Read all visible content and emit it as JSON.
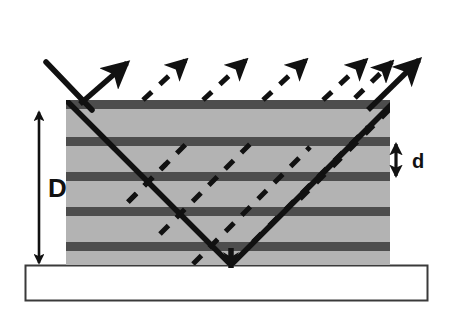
{
  "figure": {
    "labels": {
      "total_thickness": "D",
      "layer_period": "d"
    },
    "colors": {
      "matrix_fill": "#b3b3b3",
      "layer_band": "#4d4d4d",
      "ray_stroke": "#111111",
      "substrate_fill": "#ffffff",
      "substrate_stroke": "#3a3a3a",
      "background": "#ffffff"
    },
    "geometry": {
      "slab": {
        "x": 66,
        "y": 100,
        "width": 324,
        "height": 165
      },
      "substrate": {
        "x": 25,
        "y": 265,
        "width": 403,
        "height": 36
      },
      "band_thickness": 8,
      "band_period": 35,
      "band_tops": [
        100,
        137,
        172,
        207,
        242
      ],
      "incidence_angle_deg": 45
    },
    "dimension_arrows": [
      {
        "name": "D",
        "x": 39,
        "y_top": 110,
        "y_bottom": 265,
        "label_x": 52,
        "label_y": 196
      },
      {
        "name": "d",
        "x": 395,
        "y_top": 142,
        "y_bottom": 177,
        "label_x": 412,
        "label_y": 172
      }
    ],
    "rays": {
      "incident": {
        "style": "solid",
        "from": [
          46,
          62
        ],
        "to": [
          231,
          265
        ]
      },
      "specular_reflected": {
        "style": "solid",
        "from": [
          86,
          104
        ],
        "to": [
          130,
          60
        ]
      },
      "exit": {
        "style": "solid",
        "from": [
          231,
          265
        ],
        "to": [
          418,
          60
        ]
      },
      "diffracted_dashed": [
        {
          "style": "dashed",
          "from": [
            130,
            200
          ],
          "to": [
            186,
            62
          ]
        },
        {
          "style": "dashed",
          "from": [
            160,
            232
          ],
          "to": [
            246,
            62
          ]
        },
        {
          "style": "dashed",
          "from": [
            192,
            262
          ],
          "to": [
            306,
            62
          ]
        },
        {
          "style": "dashed",
          "from": [
            252,
            240
          ],
          "to": [
            366,
            62
          ]
        },
        {
          "style": "dashed",
          "from": [
            300,
            198
          ],
          "to": [
            395,
            64
          ]
        }
      ]
    }
  }
}
